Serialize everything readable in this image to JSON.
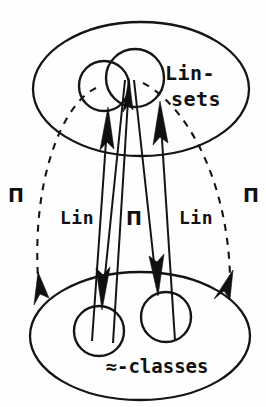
{
  "figure": {
    "kind": "commutative-diagram",
    "background_color": "#fefefe",
    "ink_color": "#151515",
    "labels": {
      "top_set_line1": "Lin-",
      "top_set_line2": "sets",
      "bottom_set": "≈-classes",
      "left_arc": "Π",
      "right_arc": "Π",
      "map_left": "Lin",
      "map_middle": "Π",
      "map_right": "Lin"
    },
    "regions": {
      "top_ellipse": {
        "name": "Lin-sets",
        "cx": 141,
        "cy": 89,
        "rx": 108,
        "ry": 67
      },
      "bottom_ellipse": {
        "name": "≈-classes",
        "cx": 140,
        "cy": 336,
        "rx": 110,
        "ry": 64
      },
      "top_circles": [
        {
          "cx": 104,
          "cy": 86,
          "r": 25
        },
        {
          "cx": 135,
          "cy": 78,
          "r": 29
        }
      ],
      "bottom_circles": [
        {
          "cx": 99,
          "cy": 331,
          "r": 25
        },
        {
          "cx": 166,
          "cy": 317,
          "r": 25
        }
      ]
    },
    "arrows": {
      "upward": [
        {
          "name": "lin-left-up",
          "from": [
            92,
            340
          ],
          "to": [
            108,
            117
          ]
        },
        {
          "name": "pi-middle-up",
          "from": [
            113,
            342
          ],
          "to": [
            130,
            82
          ]
        },
        {
          "name": "lin-right-up",
          "from": [
            175,
            340
          ],
          "to": [
            159,
            110
          ]
        }
      ],
      "downward": [
        {
          "name": "lin-left-down",
          "from": [
            125,
            80
          ],
          "to": [
            101,
            300
          ]
        },
        {
          "name": "pi-middle-down",
          "from": [
            134,
            80
          ],
          "to": [
            156,
            290
          ]
        }
      ],
      "dashed_arcs": [
        {
          "name": "pi-left-arc",
          "from": [
            96,
            88
          ],
          "to": [
            44,
            291
          ]
        },
        {
          "name": "pi-right-arc",
          "from": [
            143,
            83
          ],
          "to": [
            231,
            289
          ]
        }
      ]
    }
  }
}
